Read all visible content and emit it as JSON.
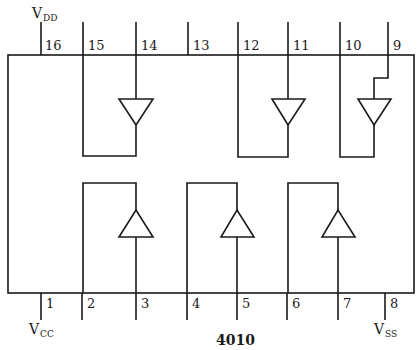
{
  "diagram": {
    "part_number": "4010",
    "supplies": {
      "vdd": {
        "main": "V",
        "sub": "DD",
        "pin": "16"
      },
      "vcc": {
        "main": "V",
        "sub": "CC",
        "pin": "1"
      },
      "vss": {
        "main": "V",
        "sub": "SS",
        "pin": "8"
      }
    },
    "top_pins": [
      {
        "number": "16"
      },
      {
        "number": "15"
      },
      {
        "number": "14"
      },
      {
        "number": "13"
      },
      {
        "number": "12"
      },
      {
        "number": "11"
      },
      {
        "number": "10"
      },
      {
        "number": "9"
      }
    ],
    "bottom_pins": [
      {
        "number": "1"
      },
      {
        "number": "2"
      },
      {
        "number": "3"
      },
      {
        "number": "4"
      },
      {
        "number": "5"
      },
      {
        "number": "6"
      },
      {
        "number": "7"
      },
      {
        "number": "8"
      }
    ],
    "buffers": [
      {
        "input_pin": "14",
        "output_pin": "15",
        "direction": "down"
      },
      {
        "input_pin": "11",
        "output_pin": "12",
        "direction": "down"
      },
      {
        "input_pin": "9",
        "output_pin": "10",
        "direction": "down"
      },
      {
        "input_pin": "3",
        "output_pin": "2",
        "direction": "up"
      },
      {
        "input_pin": "5",
        "output_pin": "4",
        "direction": "up"
      },
      {
        "input_pin": "7",
        "output_pin": "6",
        "direction": "up"
      }
    ]
  }
}
